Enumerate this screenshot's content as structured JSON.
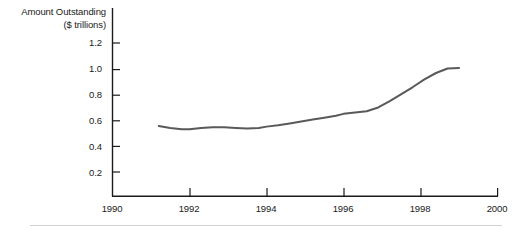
{
  "chart_data": {
    "type": "line",
    "title": "",
    "subtitle": "",
    "ylabel_line1": "Amount Outstanding",
    "ylabel_line2": "($ trillions)",
    "xlabel": "",
    "xlim": [
      1990,
      2000
    ],
    "ylim": [
      0,
      1.3
    ],
    "grid": false,
    "legend": "none",
    "y_ticks": [
      0.2,
      0.4,
      0.6,
      0.8,
      1.0,
      1.2
    ],
    "y_tick_labels": [
      "0.2",
      "0.4",
      "0.6",
      "0.8",
      "1.0",
      "1.2"
    ],
    "x_ticks": [
      1990,
      1992,
      1994,
      1996,
      1998,
      2000
    ],
    "x_tick_labels": [
      "1990",
      "1992",
      "1994",
      "1996",
      "1998",
      "2000"
    ],
    "line_color": "#595959",
    "axis_color": "#1a1a1a",
    "series": [
      {
        "name": "Amount Outstanding",
        "x": [
          1991.2,
          1991.5,
          1991.8,
          1992.0,
          1992.3,
          1992.6,
          1992.9,
          1993.2,
          1993.5,
          1993.8,
          1994.0,
          1994.3,
          1994.6,
          1994.9,
          1995.2,
          1995.5,
          1995.8,
          1996.0,
          1996.3,
          1996.6,
          1996.9,
          1997.2,
          1997.5,
          1997.8,
          1998.1,
          1998.4,
          1998.7,
          1999.0
        ],
        "values": [
          0.55,
          0.535,
          0.525,
          0.525,
          0.535,
          0.54,
          0.54,
          0.535,
          0.53,
          0.535,
          0.545,
          0.555,
          0.57,
          0.585,
          0.6,
          0.615,
          0.63,
          0.645,
          0.655,
          0.665,
          0.695,
          0.745,
          0.8,
          0.855,
          0.915,
          0.965,
          1.0,
          1.005
        ]
      }
    ]
  },
  "footer": {
    "rule_color": "#d2d2d2"
  }
}
